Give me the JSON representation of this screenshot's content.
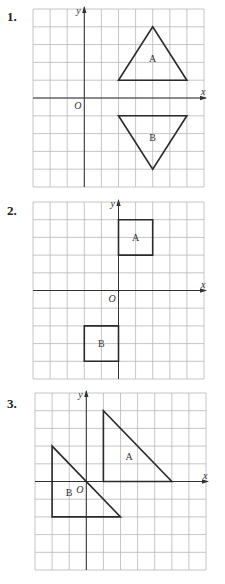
{
  "problems": [
    {
      "number": "1.",
      "top": 0,
      "label_y": 12,
      "grid": {
        "left": 33,
        "top": 9,
        "cols": 10,
        "rows": 10,
        "cell_w": 17.1,
        "cell_h": 17.8,
        "origin_col": 3,
        "origin_row": 5
      },
      "axis_labels": {
        "x": "x",
        "y": "y",
        "origin": "O"
      },
      "shapes": [
        {
          "name": "A",
          "type": "triangle",
          "points": [
            [
              2,
              1
            ],
            [
              6,
              1
            ],
            [
              4,
              4
            ]
          ],
          "label_pos": [
            4,
            2.2
          ]
        },
        {
          "name": "B",
          "type": "triangle",
          "points": [
            [
              2,
              -1
            ],
            [
              6,
              -1
            ],
            [
              4,
              -4
            ]
          ],
          "label_pos": [
            4,
            -2.2
          ]
        }
      ]
    },
    {
      "number": "2.",
      "top": 190,
      "label_y": 14,
      "grid": {
        "left": 33,
        "top": 202,
        "cols": 10,
        "rows": 10,
        "cell_w": 17.1,
        "cell_h": 17.7,
        "origin_col": 5,
        "origin_row": 5
      },
      "axis_labels": {
        "x": "x",
        "y": "y",
        "origin": "O"
      },
      "shapes": [
        {
          "name": "A",
          "type": "square",
          "points": [
            [
              0,
              4
            ],
            [
              2,
              4
            ],
            [
              2,
              2
            ],
            [
              0,
              2
            ]
          ],
          "label_pos": [
            1,
            3
          ]
        },
        {
          "name": "B",
          "type": "square",
          "points": [
            [
              -2,
              -2
            ],
            [
              0,
              -2
            ],
            [
              0,
              -4
            ],
            [
              -2,
              -4
            ]
          ],
          "label_pos": [
            -1,
            -3
          ]
        }
      ]
    },
    {
      "number": "3.",
      "top": 380,
      "label_y": 18,
      "grid": {
        "left": 35,
        "top": 393,
        "cols": 10,
        "rows": 10,
        "cell_w": 17.1,
        "cell_h": 17.7,
        "origin_col": 3,
        "origin_row": 5
      },
      "axis_labels": {
        "x": "x",
        "y": "y",
        "origin": "O"
      },
      "shapes": [
        {
          "name": "A",
          "type": "triangle",
          "points": [
            [
              1,
              4
            ],
            [
              1,
              0
            ],
            [
              5,
              0
            ]
          ],
          "label_pos": [
            2.5,
            1.4
          ]
        },
        {
          "name": "B",
          "type": "triangle",
          "points": [
            [
              -2,
              2
            ],
            [
              -2,
              -2
            ],
            [
              2,
              -2
            ]
          ],
          "label_pos": [
            -1,
            -0.6
          ]
        }
      ]
    }
  ],
  "colors": {
    "grid": "#b8b8b8",
    "axis": "#333333",
    "shape": "#2b2b2b"
  }
}
